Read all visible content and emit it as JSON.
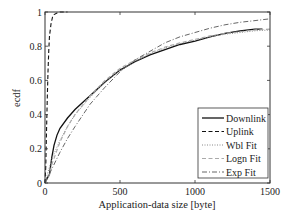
{
  "chart_data": {
    "type": "line",
    "title": "",
    "xlabel": "Application-data size [byte]",
    "ylabel": "ecdf",
    "xlim": [
      0,
      1500
    ],
    "ylim": [
      0,
      1
    ],
    "xticks": [
      0,
      500,
      1000,
      1500
    ],
    "xtick_labels": [
      "0",
      "500",
      "1000",
      "1500"
    ],
    "yticks": [
      0,
      0.2,
      0.4,
      0.6,
      0.8,
      1
    ],
    "ytick_labels": [
      "0",
      "0.2",
      "0.4",
      "0.6",
      "0.8",
      "1"
    ],
    "grid": false,
    "legend_position": "lower right",
    "series": [
      {
        "name": "Downlink",
        "style": "solid",
        "color": "#111111",
        "x": [
          0,
          10,
          30,
          45,
          60,
          80,
          100,
          150,
          200,
          300,
          400,
          500,
          600,
          700,
          800,
          900,
          1000,
          1100,
          1200,
          1300,
          1400,
          1450
        ],
        "y": [
          0,
          0.02,
          0.05,
          0.15,
          0.22,
          0.28,
          0.32,
          0.38,
          0.43,
          0.51,
          0.59,
          0.66,
          0.71,
          0.75,
          0.78,
          0.81,
          0.83,
          0.855,
          0.875,
          0.89,
          0.9,
          0.9
        ]
      },
      {
        "name": "Uplink",
        "style": "dashed",
        "color": "#111111",
        "x": [
          0,
          5,
          10,
          15,
          20,
          25,
          30,
          40,
          50,
          60,
          80,
          100,
          120,
          150
        ],
        "y": [
          0,
          0.1,
          0.3,
          0.5,
          0.65,
          0.78,
          0.86,
          0.93,
          0.97,
          0.985,
          0.995,
          1.0,
          1.0,
          1.0
        ]
      },
      {
        "name": "Wbl Fit",
        "style": "dotted",
        "color": "#888888",
        "x": [
          0,
          25,
          50,
          100,
          150,
          200,
          300,
          400,
          500,
          600,
          700,
          800,
          900,
          1000,
          1100,
          1200,
          1300,
          1400,
          1500
        ],
        "y": [
          0,
          0.08,
          0.15,
          0.25,
          0.33,
          0.4,
          0.5,
          0.59,
          0.66,
          0.71,
          0.755,
          0.79,
          0.815,
          0.835,
          0.855,
          0.87,
          0.88,
          0.89,
          0.895
        ]
      },
      {
        "name": "Logn Fit",
        "style": "dashed",
        "color": "#aaaaaa",
        "x": [
          0,
          25,
          50,
          100,
          150,
          200,
          300,
          400,
          500,
          600,
          700,
          800,
          900,
          1000,
          1100,
          1200,
          1300,
          1400,
          1500
        ],
        "y": [
          0,
          0.04,
          0.12,
          0.24,
          0.33,
          0.4,
          0.51,
          0.6,
          0.67,
          0.72,
          0.76,
          0.795,
          0.82,
          0.84,
          0.86,
          0.875,
          0.885,
          0.895,
          0.9
        ]
      },
      {
        "name": "Exp Fit",
        "style": "dashdot",
        "color": "#666666",
        "x": [
          0,
          50,
          100,
          150,
          200,
          300,
          400,
          500,
          600,
          700,
          800,
          900,
          1000,
          1100,
          1200,
          1300,
          1400,
          1500
        ],
        "y": [
          0,
          0.09,
          0.18,
          0.26,
          0.33,
          0.46,
          0.56,
          0.65,
          0.72,
          0.77,
          0.82,
          0.855,
          0.88,
          0.905,
          0.925,
          0.94,
          0.95,
          0.96
        ]
      }
    ]
  }
}
